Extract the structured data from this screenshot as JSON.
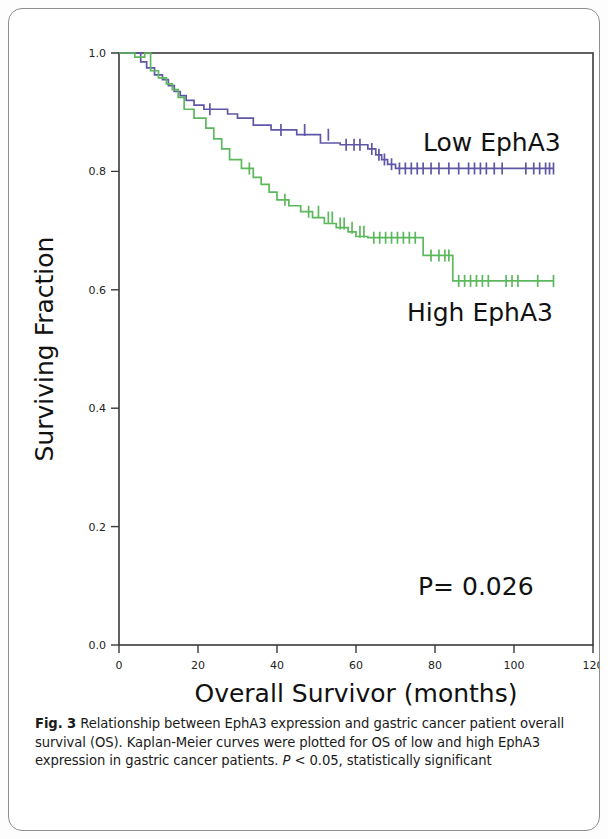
{
  "figure": {
    "number": "Fig. 3",
    "caption_bold": "Fig. 3",
    "caption_text": " Relationship between EphA3 expression and gastric cancer patient overall survival (OS). Kaplan-Meier curves were plotted for OS of low and high EphA3 expression in gastric cancer patients. ",
    "caption_italic_p": "P",
    "caption_tail": " < 0.05, statistically significant"
  },
  "annotations": {
    "low_label": "Low EphA3",
    "high_label": "High EphA3",
    "pvalue": "P= 0.026"
  },
  "colors": {
    "low_curve": "#5f57a6",
    "high_curve": "#5cb85c",
    "axis": "#3a3a3a",
    "text": "#111111",
    "frame": "#8d8d8d"
  },
  "chart_data": {
    "type": "line",
    "subtype": "kaplan-meier-step",
    "title": "",
    "xlabel": "Overall Survivor (months)",
    "ylabel": "Surviving Fraction",
    "xlim": [
      0,
      120
    ],
    "ylim": [
      0.0,
      1.0
    ],
    "xticks": [
      0,
      20,
      40,
      60,
      80,
      100,
      120
    ],
    "xticklabels": [
      "0",
      "20",
      "40",
      "60",
      "80",
      "100",
      "120"
    ],
    "yticks": [
      0.0,
      0.2,
      0.4,
      0.6,
      0.8,
      1.0
    ],
    "yticklabels": [
      "0.0",
      "0.2",
      "0.4",
      "0.6",
      "0.8",
      "1.0"
    ],
    "grid": false,
    "legend_position": "in-plot-annotations",
    "statistic": {
      "label": "P=",
      "value": 0.026,
      "display": "P= 0.026"
    },
    "series": [
      {
        "name": "Low EphA3",
        "color": "#5f57a6",
        "final_survival": 0.805,
        "max_followup": 110,
        "steps": [
          [
            0,
            1.0
          ],
          [
            5.5,
            1.0
          ],
          [
            5.5,
            0.985
          ],
          [
            7.0,
            0.985
          ],
          [
            7.0,
            0.975
          ],
          [
            9.0,
            0.975
          ],
          [
            9.0,
            0.963
          ],
          [
            11.0,
            0.963
          ],
          [
            11.0,
            0.955
          ],
          [
            12.5,
            0.955
          ],
          [
            12.5,
            0.945
          ],
          [
            14.0,
            0.945
          ],
          [
            14.0,
            0.935
          ],
          [
            15.5,
            0.935
          ],
          [
            15.5,
            0.928
          ],
          [
            17.0,
            0.928
          ],
          [
            17.0,
            0.92
          ],
          [
            19.0,
            0.92
          ],
          [
            19.0,
            0.912
          ],
          [
            21.5,
            0.912
          ],
          [
            21.5,
            0.905
          ],
          [
            27.5,
            0.905
          ],
          [
            27.5,
            0.897
          ],
          [
            30.0,
            0.897
          ],
          [
            30.0,
            0.89
          ],
          [
            34.0,
            0.89
          ],
          [
            34.0,
            0.878
          ],
          [
            38.5,
            0.878
          ],
          [
            38.5,
            0.87
          ],
          [
            45.0,
            0.87
          ],
          [
            45.0,
            0.862
          ],
          [
            51.0,
            0.862
          ],
          [
            51.0,
            0.848
          ],
          [
            56.0,
            0.848
          ],
          [
            56.0,
            0.845
          ],
          [
            63.0,
            0.845
          ],
          [
            63.0,
            0.838
          ],
          [
            65.0,
            0.838
          ],
          [
            65.0,
            0.828
          ],
          [
            66.5,
            0.828
          ],
          [
            66.5,
            0.82
          ],
          [
            68.0,
            0.82
          ],
          [
            68.0,
            0.812
          ],
          [
            70.0,
            0.812
          ],
          [
            70.0,
            0.805
          ],
          [
            110,
            0.805
          ]
        ],
        "censored": [
          [
            23.0,
            0.905
          ],
          [
            41.0,
            0.87
          ],
          [
            47.0,
            0.87
          ],
          [
            53.0,
            0.862
          ],
          [
            57.5,
            0.845
          ],
          [
            59.5,
            0.845
          ],
          [
            61.0,
            0.845
          ],
          [
            64.0,
            0.838
          ],
          [
            65.8,
            0.828
          ],
          [
            67.2,
            0.82
          ],
          [
            69.0,
            0.812
          ],
          [
            71.0,
            0.805
          ],
          [
            72.5,
            0.805
          ],
          [
            74.0,
            0.805
          ],
          [
            75.5,
            0.805
          ],
          [
            77.0,
            0.805
          ],
          [
            79.0,
            0.805
          ],
          [
            81.0,
            0.805
          ],
          [
            83.5,
            0.805
          ],
          [
            86.0,
            0.805
          ],
          [
            88.5,
            0.805
          ],
          [
            90.0,
            0.805
          ],
          [
            91.5,
            0.805
          ],
          [
            93.0,
            0.805
          ],
          [
            95.0,
            0.805
          ],
          [
            97.0,
            0.805
          ],
          [
            103.0,
            0.805
          ],
          [
            105.0,
            0.805
          ],
          [
            106.5,
            0.805
          ],
          [
            108.0,
            0.805
          ],
          [
            109.0,
            0.805
          ],
          [
            110.0,
            0.805
          ]
        ]
      },
      {
        "name": "High EphA3",
        "color": "#5cb85c",
        "final_survival": 0.615,
        "max_followup": 110,
        "steps": [
          [
            0,
            1.0
          ],
          [
            4.0,
            1.0
          ],
          [
            4.0,
            0.993
          ],
          [
            6.5,
            0.993
          ],
          [
            6.5,
            1.0
          ],
          [
            8.0,
            1.0
          ],
          [
            8.0,
            0.97
          ],
          [
            10.0,
            0.97
          ],
          [
            10.0,
            0.958
          ],
          [
            12.0,
            0.958
          ],
          [
            12.0,
            0.948
          ],
          [
            13.5,
            0.948
          ],
          [
            13.5,
            0.938
          ],
          [
            15.0,
            0.938
          ],
          [
            15.0,
            0.925
          ],
          [
            16.5,
            0.925
          ],
          [
            16.5,
            0.905
          ],
          [
            19.0,
            0.905
          ],
          [
            19.0,
            0.89
          ],
          [
            22.0,
            0.89
          ],
          [
            22.0,
            0.873
          ],
          [
            24.0,
            0.873
          ],
          [
            24.0,
            0.855
          ],
          [
            26.0,
            0.855
          ],
          [
            26.0,
            0.838
          ],
          [
            28.0,
            0.838
          ],
          [
            28.0,
            0.82
          ],
          [
            31.0,
            0.82
          ],
          [
            31.0,
            0.805
          ],
          [
            34.0,
            0.805
          ],
          [
            34.0,
            0.79
          ],
          [
            36.0,
            0.79
          ],
          [
            36.0,
            0.778
          ],
          [
            38.0,
            0.778
          ],
          [
            38.0,
            0.765
          ],
          [
            40.0,
            0.765
          ],
          [
            40.0,
            0.752
          ],
          [
            43.0,
            0.752
          ],
          [
            43.0,
            0.742
          ],
          [
            46.0,
            0.742
          ],
          [
            46.0,
            0.732
          ],
          [
            49.0,
            0.732
          ],
          [
            49.0,
            0.722
          ],
          [
            52.0,
            0.722
          ],
          [
            52.0,
            0.712
          ],
          [
            55.0,
            0.712
          ],
          [
            55.0,
            0.705
          ],
          [
            58.0,
            0.705
          ],
          [
            58.0,
            0.698
          ],
          [
            60.0,
            0.698
          ],
          [
            60.0,
            0.69
          ],
          [
            63.0,
            0.69
          ],
          [
            63.0,
            0.688
          ],
          [
            77.0,
            0.688
          ],
          [
            77.0,
            0.658
          ],
          [
            84.5,
            0.658
          ],
          [
            84.5,
            0.615
          ],
          [
            110,
            0.615
          ]
        ],
        "censored": [
          [
            33.0,
            0.805
          ],
          [
            42.0,
            0.752
          ],
          [
            48.0,
            0.732
          ],
          [
            50.5,
            0.732
          ],
          [
            53.0,
            0.722
          ],
          [
            54.0,
            0.722
          ],
          [
            56.0,
            0.712
          ],
          [
            57.0,
            0.712
          ],
          [
            59.0,
            0.705
          ],
          [
            61.0,
            0.698
          ],
          [
            62.0,
            0.698
          ],
          [
            64.5,
            0.688
          ],
          [
            66.0,
            0.688
          ],
          [
            67.5,
            0.688
          ],
          [
            69.0,
            0.688
          ],
          [
            70.5,
            0.688
          ],
          [
            72.0,
            0.688
          ],
          [
            73.5,
            0.688
          ],
          [
            75.0,
            0.688
          ],
          [
            79.0,
            0.658
          ],
          [
            81.0,
            0.658
          ],
          [
            82.5,
            0.658
          ],
          [
            83.5,
            0.658
          ],
          [
            86.0,
            0.615
          ],
          [
            87.5,
            0.615
          ],
          [
            89.0,
            0.615
          ],
          [
            90.5,
            0.615
          ],
          [
            92.0,
            0.615
          ],
          [
            93.5,
            0.615
          ],
          [
            98.0,
            0.615
          ],
          [
            99.5,
            0.615
          ],
          [
            101.0,
            0.615
          ],
          [
            106.0,
            0.615
          ],
          [
            110.0,
            0.615
          ]
        ]
      }
    ]
  }
}
